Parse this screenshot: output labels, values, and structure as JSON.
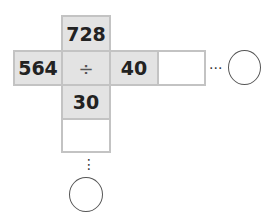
{
  "diagram": {
    "top": "728",
    "left": "564",
    "operator": "÷",
    "right": "40",
    "bottom": "30",
    "right_blank": "",
    "bottom_blank": "",
    "horizontal_dots": "···",
    "vertical_dots": "⋮"
  }
}
